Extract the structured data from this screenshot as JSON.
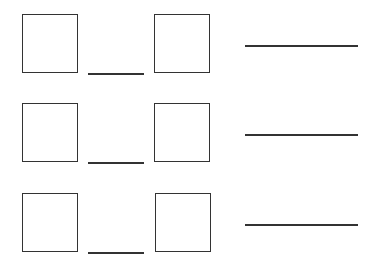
{
  "worksheet": {
    "rows": [
      {
        "box_left": {
          "x": 22,
          "y": 14
        },
        "short_line": {
          "x": 88,
          "y": 73,
          "width": 56
        },
        "box_right": {
          "x": 154,
          "y": 14
        },
        "answer_line": {
          "x": 245,
          "y": 45,
          "width": 113
        }
      },
      {
        "box_left": {
          "x": 22,
          "y": 103
        },
        "short_line": {
          "x": 88,
          "y": 162,
          "width": 56
        },
        "box_right": {
          "x": 154,
          "y": 103
        },
        "answer_line": {
          "x": 245,
          "y": 134,
          "width": 113
        }
      },
      {
        "box_left": {
          "x": 22,
          "y": 193
        },
        "short_line": {
          "x": 88,
          "y": 252,
          "width": 56
        },
        "box_right": {
          "x": 155,
          "y": 193
        },
        "answer_line": {
          "x": 245,
          "y": 224,
          "width": 113
        }
      }
    ],
    "stroke_color": "#333333",
    "background_color": "#ffffff"
  }
}
